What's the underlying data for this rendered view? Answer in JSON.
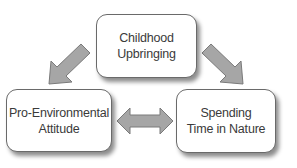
{
  "diagram": {
    "nodes": [
      {
        "id": "childhood-upbringing",
        "label": "Childhood\nUpbringing"
      },
      {
        "id": "pro-environmental-attitude",
        "label": "Pro-Environmental\nAttitude"
      },
      {
        "id": "spending-time-in-nature",
        "label": "Spending\nTime in Nature"
      }
    ],
    "edges": [
      {
        "from": "childhood-upbringing",
        "to": "pro-environmental-attitude",
        "type": "one-way"
      },
      {
        "from": "childhood-upbringing",
        "to": "spending-time-in-nature",
        "type": "one-way"
      },
      {
        "from": "pro-environmental-attitude",
        "to": "spending-time-in-nature",
        "type": "two-way"
      }
    ],
    "colors": {
      "arrow_fill": "#a6a6a6",
      "arrow_stroke": "#7a7a7a",
      "box_border": "#6a6a6a",
      "text": "#3a3a3a"
    }
  }
}
